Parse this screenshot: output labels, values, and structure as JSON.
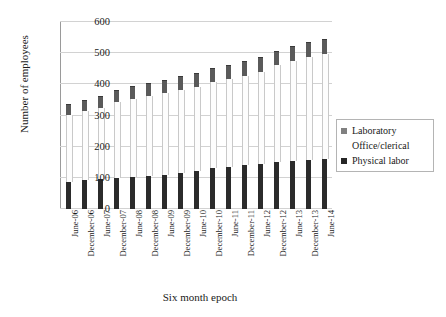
{
  "chart_data": {
    "type": "bar",
    "subtype": "stacked-column-3d",
    "title": "",
    "xlabel": "Six month epoch",
    "ylabel": "Number of employees",
    "ylim": [
      0,
      600
    ],
    "yticks": [
      0,
      100,
      200,
      300,
      400,
      500,
      600
    ],
    "grid": true,
    "legend_position": "right-middle",
    "categories": [
      "June-06",
      "December-06",
      "June-07",
      "December-07",
      "June-08",
      "December-08",
      "June-09",
      "December-09",
      "June-10",
      "December-10",
      "June-11",
      "December-11",
      "June-12",
      "December-12",
      "June-13",
      "December-13",
      "June-14"
    ],
    "series": [
      {
        "name": "Physical labor",
        "color": "#2b2b2b",
        "values": [
          88,
          92,
          95,
          99,
          104,
          106,
          110,
          115,
          122,
          131,
          136,
          140,
          145,
          150,
          154,
          158,
          162
        ]
      },
      {
        "name": "Office/clerical",
        "color": "#fdfdfd",
        "values": [
          215,
          222,
          230,
          245,
          250,
          258,
          262,
          268,
          270,
          275,
          282,
          288,
          295,
          312,
          322,
          330,
          336
        ]
      },
      {
        "name": "Laboratory",
        "color": "#5a5a5a",
        "values": [
          32,
          33,
          35,
          36,
          37,
          38,
          40,
          40,
          41,
          42,
          42,
          43,
          43,
          43,
          44,
          44,
          45
        ]
      }
    ],
    "totals": [
      335,
      347,
      360,
      380,
      391,
      402,
      412,
      423,
      433,
      448,
      460,
      471,
      483,
      505,
      520,
      532,
      543
    ]
  },
  "legend": {
    "items": [
      {
        "label": "Laboratory",
        "swatch": "laboratory-swatch"
      },
      {
        "label": "Office/clerical",
        "swatch": "office-clerical-swatch"
      },
      {
        "label": "Physical labor",
        "swatch": "physical-labor-swatch"
      }
    ]
  },
  "axes": {
    "y_title": "Number of  employees",
    "x_title": "Six month epoch"
  }
}
